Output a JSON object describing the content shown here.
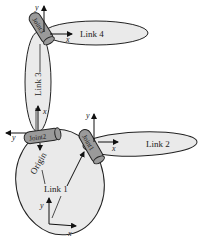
{
  "diagram": {
    "links": [
      {
        "id": "link1",
        "label": "Link 1"
      },
      {
        "id": "link2",
        "label": "Link 2"
      },
      {
        "id": "link3",
        "label": "Link 3"
      },
      {
        "id": "link4",
        "label": "Link 4"
      }
    ],
    "joints": [
      {
        "id": "joint1",
        "label": "Joint1"
      },
      {
        "id": "joint2",
        "label": "Joint2"
      },
      {
        "id": "joint3",
        "label": "Joint3"
      }
    ],
    "origin_label": "Origin",
    "axes": {
      "x": "x",
      "y": "y"
    },
    "colors": {
      "link_fill": "#eaeaea",
      "joint_fill": "#9a9a9a",
      "stroke": "#222222"
    }
  }
}
